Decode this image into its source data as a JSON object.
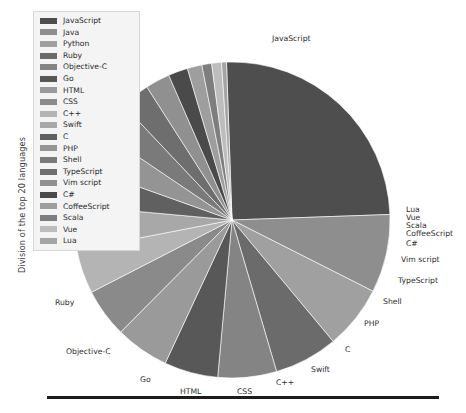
{
  "figure": {
    "ylabel": "Division of the top 20 languages",
    "background": "#ffffff",
    "rule_color": "#1c1c1c"
  },
  "legend": {
    "background": "#f4f4f4",
    "border": "#d7d7d7",
    "items": [
      {
        "label": "JavaScript",
        "color": "#4e4e4e"
      },
      {
        "label": "Java",
        "color": "#8e8e8e"
      },
      {
        "label": "Python",
        "color": "#a0a0a0"
      },
      {
        "label": "Ruby",
        "color": "#6b6b6b"
      },
      {
        "label": "Objective-C",
        "color": "#848484"
      },
      {
        "label": "Go",
        "color": "#585858"
      },
      {
        "label": "HTML",
        "color": "#9a9a9a"
      },
      {
        "label": "CSS",
        "color": "#8a8a8a"
      },
      {
        "label": "C++",
        "color": "#b4b4b4"
      },
      {
        "label": "Swift",
        "color": "#a8a8a8"
      },
      {
        "label": "C",
        "color": "#606060"
      },
      {
        "label": "PHP",
        "color": "#949494"
      },
      {
        "label": "Shell",
        "color": "#7a7a7a"
      },
      {
        "label": "TypeScript",
        "color": "#6e6e6e"
      },
      {
        "label": "Vim script",
        "color": "#909090"
      },
      {
        "label": "C#",
        "color": "#4a4a4a"
      },
      {
        "label": "CoffeeScript",
        "color": "#9e9e9e"
      },
      {
        "label": "Scala",
        "color": "#7e7e7e"
      },
      {
        "label": "Vue",
        "color": "#bdbdbd"
      },
      {
        "label": "Lua",
        "color": "#a4a4a4"
      }
    ]
  },
  "chart_data": {
    "type": "pie",
    "title": "",
    "xlabel": "",
    "ylabel": "Division of the top 20 languages",
    "legend_position": "upper-left",
    "start_angle_deg": -2,
    "direction": "clockwise",
    "center": {
      "x": 232,
      "y": 220
    },
    "radius": 158,
    "categories": [
      "JavaScript",
      "Java",
      "Python",
      "Ruby",
      "Objective-C",
      "Go",
      "HTML",
      "CSS",
      "C++",
      "Swift",
      "C",
      "PHP",
      "Shell",
      "TypeScript",
      "Vim script",
      "C#",
      "CoffeeScript",
      "Scala",
      "Vue",
      "Lua"
    ],
    "values": [
      25.0,
      8.0,
      6.5,
      6.5,
      6.0,
      5.5,
      5.5,
      5.0,
      4.5,
      4.5,
      4.0,
      4.0,
      3.5,
      3.0,
      2.5,
      2.0,
      1.5,
      1.0,
      1.0,
      0.5
    ],
    "unit": "percent",
    "outside_labels": [
      {
        "name": "JavaScript",
        "x": 272,
        "y": 35
      },
      {
        "name": "Lua",
        "x": 406,
        "y": 206
      },
      {
        "name": "Vue",
        "x": 406,
        "y": 214
      },
      {
        "name": "Scala",
        "x": 406,
        "y": 222
      },
      {
        "name": "CoffeeScript",
        "x": 406,
        "y": 230
      },
      {
        "name": "C#",
        "x": 406,
        "y": 240
      },
      {
        "name": "Vim script",
        "x": 401,
        "y": 256
      },
      {
        "name": "TypeScript",
        "x": 398,
        "y": 277
      },
      {
        "name": "Shell",
        "x": 383,
        "y": 298
      },
      {
        "name": "PHP",
        "x": 364,
        "y": 320
      },
      {
        "name": "C",
        "x": 345,
        "y": 346
      },
      {
        "name": "Swift",
        "x": 311,
        "y": 366
      },
      {
        "name": "C++",
        "x": 276,
        "y": 379
      },
      {
        "name": "CSS",
        "x": 237,
        "y": 388
      },
      {
        "name": "HTML",
        "x": 180,
        "y": 388
      },
      {
        "name": "Go",
        "x": 140,
        "y": 376
      },
      {
        "name": "Objective-C",
        "x": 66,
        "y": 348
      },
      {
        "name": "Ruby",
        "x": 55,
        "y": 299
      }
    ]
  }
}
